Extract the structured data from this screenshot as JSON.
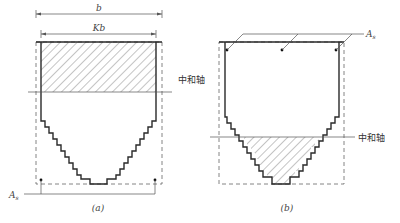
{
  "figure": {
    "panel_a": {
      "caption": "(a)",
      "dim_outer_label": "b",
      "dim_inner_label": "Kb",
      "neutral_axis_label": "中和轴",
      "steel_label": "A",
      "steel_label_sub": "s",
      "hatched_region": "compression zone above neutral axis (top flange)"
    },
    "panel_b": {
      "caption": "(b)",
      "neutral_axis_label": "中和轴",
      "steel_label": "A",
      "steel_label_sub": "s",
      "hatched_region": "compression zone below neutral axis (stepped web)"
    },
    "colors": {
      "line": "#2a2a2a",
      "dashed": "#666666",
      "hatch": "#555555",
      "background": "#ffffff"
    }
  }
}
